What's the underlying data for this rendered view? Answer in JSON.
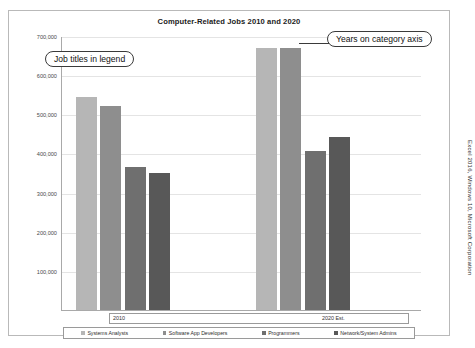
{
  "attribution": "Excel 2016, Windows 10, Microsoft Corporation",
  "callouts": {
    "legend_note": "Job titles in legend",
    "axis_note": "Years on category axis"
  },
  "chart_data": {
    "type": "bar",
    "title": "Computer-Related Jobs 2010 and 2020",
    "xlabel": "",
    "ylabel": "",
    "categories": [
      "2010",
      "2020 Est."
    ],
    "series": [
      {
        "name": "Systems Analysts",
        "color": "#b6b6b6",
        "values": [
          544000,
          670000
        ]
      },
      {
        "name": "Software App Developers",
        "color": "#8e8e8e",
        "values": [
          522000,
          670000
        ]
      },
      {
        "name": "Programmers",
        "color": "#6f6f6f",
        "values": [
          365000,
          407000
        ]
      },
      {
        "name": "Network/System Admins",
        "color": "#585858",
        "values": [
          350000,
          441000
        ]
      }
    ],
    "ylim": [
      0,
      700000
    ],
    "yticks": [
      700000,
      600000,
      500000,
      400000,
      300000,
      200000,
      100000
    ],
    "ytick_labels": [
      "700,000",
      "600,000",
      "500,000",
      "400,000",
      "300,000",
      "200,000",
      "100,000"
    ],
    "grid": true,
    "legend_position": "bottom"
  }
}
